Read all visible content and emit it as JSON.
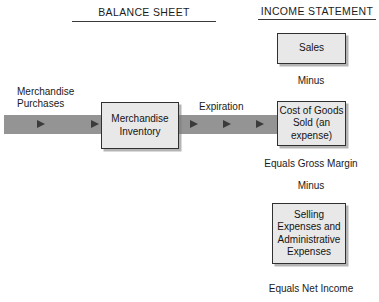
{
  "diagram": {
    "background_color": "#ffffff",
    "band_color": "#949494",
    "box_fill_color": "#e8e8e8",
    "box_border_color": "#303030",
    "arrow_color": "#3b3b3b"
  },
  "headers": {
    "balance_sheet": "BALANCE SHEET",
    "income_statement": "INCOME STATEMENT"
  },
  "flow": {
    "input_label": "Merchandise\nPurchases",
    "transfer_label": "Expiration",
    "arrow_count": 6
  },
  "boxes": {
    "merchandise_inventory": "Merchandise\nInventory",
    "sales": "Sales",
    "cost_of_goods_sold": "Cost of\nGoods Sold\n(an expense)",
    "selling_admin_expenses": "Selling\nExpenses\nand\nAdministrative\nExpenses"
  },
  "captions": {
    "minus_1": "Minus",
    "equals_gross_margin": "Equals Gross Margin",
    "minus_2": "Minus",
    "equals_net_income": "Equals Net Income"
  }
}
